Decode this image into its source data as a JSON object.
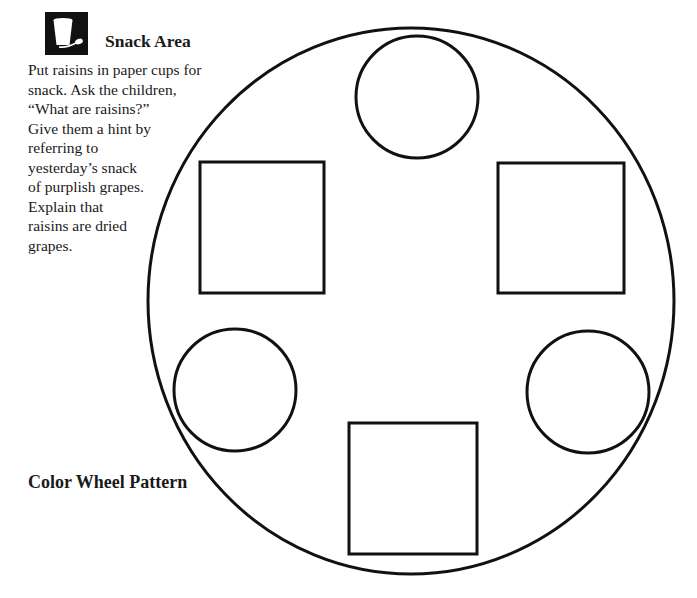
{
  "snack_area": {
    "icon": "cup-and-spoon-icon",
    "title": "Snack Area",
    "lines": [
      "Put raisins in paper cups for",
      "snack.  Ask the children,",
      "“What are raisins?”",
      "Give them a hint by",
      "referring to",
      "yesterday’s snack",
      "of purplish grapes.",
      "Explain that",
      "raisins are dried",
      "grapes."
    ]
  },
  "pattern": {
    "title": "Color Wheel Pattern",
    "stroke_color": "#111111",
    "outer_circle": {
      "cx": 411,
      "cy": 301,
      "rx": 263,
      "ry": 273
    },
    "shapes": [
      {
        "type": "circle",
        "position": "top",
        "cx": 417,
        "cy": 97,
        "r": 61
      },
      {
        "type": "square",
        "position": "upper-left",
        "x": 200,
        "y": 162,
        "w": 124,
        "h": 131
      },
      {
        "type": "square",
        "position": "upper-right",
        "x": 498,
        "y": 163,
        "w": 126,
        "h": 130
      },
      {
        "type": "circle",
        "position": "lower-left",
        "cx": 235,
        "cy": 390,
        "r": 61
      },
      {
        "type": "circle",
        "position": "lower-right",
        "cx": 588,
        "cy": 392,
        "r": 61
      },
      {
        "type": "square",
        "position": "bottom",
        "x": 349,
        "y": 423,
        "w": 128,
        "h": 131
      }
    ]
  }
}
